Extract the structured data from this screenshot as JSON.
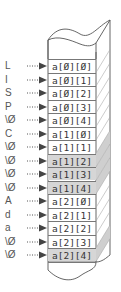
{
  "diagram": {
    "colors": {
      "stroke": "#555555",
      "shade": "#d6d6d6",
      "side": "#f0f0f0"
    },
    "rows": [
      {
        "char": "L",
        "cell": "a[0][0]",
        "shaded": false
      },
      {
        "char": "I",
        "cell": "a[0][1]",
        "shaded": false
      },
      {
        "char": "S",
        "cell": "a[0][2]",
        "shaded": false
      },
      {
        "char": "P",
        "cell": "a[0][3]",
        "shaded": false
      },
      {
        "char": "\\0",
        "cell": "a[0][4]",
        "shaded": false
      },
      {
        "char": "C",
        "cell": "a[1][0]",
        "shaded": false
      },
      {
        "char": "\\0",
        "cell": "a[1][1]",
        "shaded": false
      },
      {
        "char": "\\0",
        "cell": "a[1][2]",
        "shaded": true
      },
      {
        "char": "\\0",
        "cell": "a[1][3]",
        "shaded": true
      },
      {
        "char": "\\0",
        "cell": "a[1][4]",
        "shaded": true
      },
      {
        "char": "A",
        "cell": "a[2][0]",
        "shaded": false
      },
      {
        "char": "d",
        "cell": "a[2][1]",
        "shaded": false
      },
      {
        "char": "a",
        "cell": "a[2][2]",
        "shaded": false
      },
      {
        "char": "\\0",
        "cell": "a[2][3]",
        "shaded": false
      },
      {
        "char": "\\0",
        "cell": "a[2][4]",
        "shaded": true
      }
    ]
  }
}
